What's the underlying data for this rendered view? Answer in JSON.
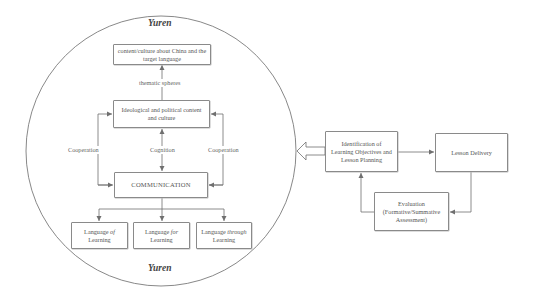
{
  "circle": {
    "top_label": "Yuren",
    "bottom_label": "Yuren"
  },
  "inner": {
    "top_box": "content/culture about China and the target language",
    "thematic_label": "thematic spheres",
    "ideological_box": "Ideological and political content and culture",
    "left_label": "Cooperation",
    "center_label": "Cognition",
    "right_label": "Cooperation",
    "communication_box": "COMMUNICATION",
    "lang_boxes": [
      {
        "pre": "Language ",
        "prep": "of",
        "post": " Learning"
      },
      {
        "pre": "Language ",
        "prep": "for",
        "post": " Learning"
      },
      {
        "pre": "Language ",
        "prep": "through",
        "post": " Learning"
      }
    ]
  },
  "cycle": {
    "identification_box": "Identification of Learning Objectives and Lesson Planning",
    "delivery_box": "Lesson Delivery",
    "evaluation_title": "Evaluation",
    "evaluation_sub": "(Formative/Summative Assessment)"
  },
  "colors": {
    "line": "#6f6f6f",
    "border": "#8a8a8a",
    "text": "#555555"
  }
}
